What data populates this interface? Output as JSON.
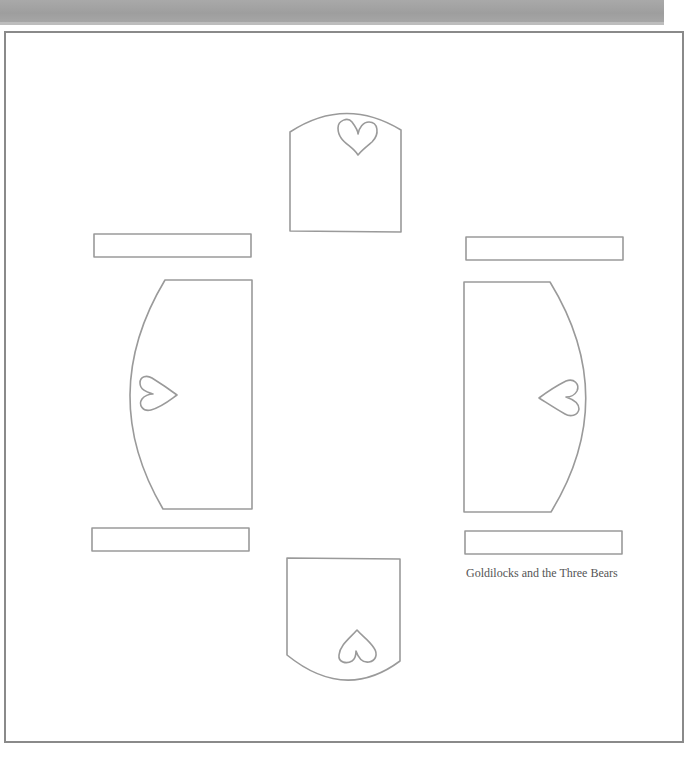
{
  "document": {
    "caption": "Goldilocks and the Three Bears",
    "colors": {
      "outline": "#9a9a9a",
      "header_band": "#a3a3a3",
      "frame": "#8a8a8a",
      "caption": "#555555"
    },
    "pieces": [
      {
        "name": "chair-back-top",
        "shape": "arched-panel",
        "icon": "heart-icon"
      },
      {
        "name": "chair-back-bottom",
        "shape": "arched-panel",
        "icon": "heart-icon"
      },
      {
        "name": "chair-side-left",
        "shape": "curved-panel",
        "icon": "heart-icon"
      },
      {
        "name": "chair-side-right",
        "shape": "curved-panel",
        "icon": "heart-icon"
      },
      {
        "name": "strip-top-left",
        "shape": "rectangle"
      },
      {
        "name": "strip-top-right",
        "shape": "rectangle"
      },
      {
        "name": "strip-bottom-left",
        "shape": "rectangle"
      },
      {
        "name": "strip-bottom-right",
        "shape": "rectangle"
      }
    ]
  }
}
